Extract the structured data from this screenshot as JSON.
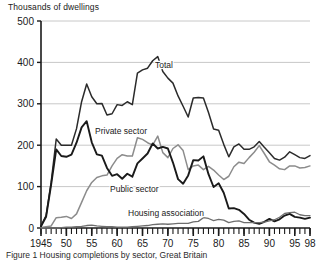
{
  "figure": {
    "y_axis_title": "Thousands of dwellings",
    "caption": "Figure 1 Housing completions by sector, Great Britain"
  },
  "colors": {
    "total_line": "#2b2b2b",
    "private_line": "#8c8c8c",
    "public_line": "#1a1a1a",
    "housing_association_line": "#6e6e6e",
    "gridline": "#c8c8c8",
    "axis": "#1a1a1a",
    "text": "#1a1a1a",
    "background": "#ffffff"
  },
  "chart_data": {
    "type": "line",
    "title": "",
    "xlabel": "",
    "ylabel": "Thousands of dwellings",
    "xlim": [
      1945,
      1998
    ],
    "ylim": [
      0,
      500
    ],
    "yticks": [
      0,
      100,
      200,
      300,
      400,
      500
    ],
    "ytick_labels": [
      "0",
      "100",
      "200",
      "300",
      "400",
      "500"
    ],
    "xticks": [
      1945,
      1950,
      1955,
      1960,
      1965,
      1970,
      1975,
      1980,
      1985,
      1990,
      1995,
      1998
    ],
    "xtick_labels": [
      "1945",
      "50",
      "55",
      "60",
      "65",
      "70",
      "75",
      "80",
      "85",
      "90",
      "95",
      "98"
    ],
    "minor_xticks": "every year 1945-1998",
    "grid": "horizontal only",
    "legend_position": "inline labels on plot",
    "x": [
      1945,
      1946,
      1947,
      1948,
      1949,
      1950,
      1951,
      1952,
      1953,
      1954,
      1955,
      1956,
      1957,
      1958,
      1959,
      1960,
      1961,
      1962,
      1963,
      1964,
      1965,
      1966,
      1967,
      1968,
      1969,
      1970,
      1971,
      1972,
      1973,
      1974,
      1975,
      1976,
      1977,
      1978,
      1979,
      1980,
      1981,
      1982,
      1983,
      1984,
      1985,
      1986,
      1987,
      1988,
      1989,
      1990,
      1991,
      1992,
      1993,
      1994,
      1995,
      1996,
      1997,
      1998
    ],
    "series": [
      {
        "name": "Total",
        "label": "Total",
        "color": "#2b2b2b",
        "values": [
          5,
          30,
          110,
          215,
          200,
          200,
          200,
          240,
          305,
          348,
          317,
          300,
          301,
          273,
          276,
          298,
          296,
          305,
          298,
          374,
          382,
          386,
          404,
          414,
          378,
          362,
          350,
          319,
          294,
          268,
          314,
          315,
          314,
          279,
          239,
          236,
          202,
          172,
          196,
          203,
          190,
          190,
          196,
          209,
          195,
          182,
          168,
          164,
          171,
          184,
          177,
          170,
          168,
          175
        ]
      },
      {
        "name": "Private sector",
        "label": "Private sector",
        "color": "#8c8c8c",
        "values": [
          1,
          3,
          5,
          25,
          26,
          28,
          23,
          34,
          62,
          90,
          110,
          122,
          126,
          128,
          150,
          168,
          177,
          174,
          174,
          218,
          214,
          206,
          200,
          222,
          182,
          170,
          192,
          201,
          187,
          141,
          150,
          152,
          141,
          149,
          140,
          128,
          117,
          125,
          148,
          159,
          156,
          170,
          183,
          199,
          180,
          160,
          152,
          143,
          141,
          150,
          150,
          145,
          146,
          150
        ]
      },
      {
        "name": "Public sector",
        "label": "Public sector",
        "color": "#1a1a1a",
        "values": [
          4,
          27,
          105,
          190,
          174,
          172,
          177,
          206,
          243,
          258,
          207,
          178,
          175,
          145,
          126,
          130,
          119,
          131,
          124,
          156,
          168,
          180,
          204,
          192,
          196,
          192,
          158,
          118,
          107,
          127,
          164,
          163,
          173,
          130,
          99,
          108,
          85,
          47,
          48,
          44,
          34,
          20,
          13,
          10,
          15,
          22,
          16,
          21,
          30,
          34,
          27,
          25,
          22,
          25
        ]
      },
      {
        "name": "Housing association",
        "label": "Housing association",
        "color": "#6e6e6e",
        "values": [
          0,
          0,
          0,
          0,
          1,
          2,
          2,
          3,
          4,
          6,
          7,
          5,
          4,
          3,
          3,
          2,
          2,
          2,
          3,
          4,
          5,
          6,
          8,
          9,
          10,
          9,
          10,
          11,
          11,
          11,
          15,
          16,
          25,
          23,
          18,
          21,
          19,
          13,
          16,
          17,
          13,
          13,
          13,
          13,
          14,
          17,
          20,
          26,
          35,
          37,
          38,
          32,
          30,
          30
        ]
      }
    ]
  },
  "series_labels": [
    {
      "text": "Total",
      "x": 155,
      "y": 68
    },
    {
      "text": "Private sector",
      "x": 95,
      "y": 134
    },
    {
      "text": "Public sector",
      "x": 110,
      "y": 192
    },
    {
      "text": "Housing association",
      "x": 128,
      "y": 216
    }
  ]
}
